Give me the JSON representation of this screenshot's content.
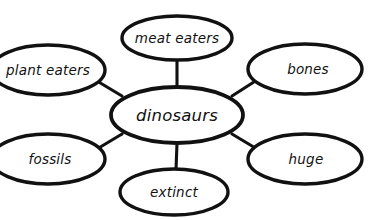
{
  "diagram": {
    "type": "concept-map",
    "background_color": "#ffffff",
    "stroke_color": "#111111",
    "text_color": "#111111",
    "central_node": {
      "id": "dinosaurs",
      "label": "dinosaurs",
      "cx": 177,
      "cy": 115,
      "rx": 66,
      "ry": 28
    },
    "satellite_nodes": [
      {
        "id": "meat-eaters",
        "label": "meat eaters",
        "position": "top",
        "cx": 177,
        "cy": 38,
        "rx": 55,
        "ry": 22
      },
      {
        "id": "bones",
        "label": "bones",
        "position": "top-right",
        "cx": 305,
        "cy": 69,
        "rx": 57,
        "ry": 25
      },
      {
        "id": "huge",
        "label": "huge",
        "position": "bottom-right",
        "cx": 305,
        "cy": 159,
        "rx": 57,
        "ry": 25
      },
      {
        "id": "extinct",
        "label": "extinct",
        "position": "bottom",
        "cx": 174,
        "cy": 192,
        "rx": 54,
        "ry": 23
      },
      {
        "id": "fossils",
        "label": "fossils",
        "position": "bottom-left",
        "cx": 48,
        "cy": 159,
        "rx": 57,
        "ry": 25
      },
      {
        "id": "plant-eaters",
        "label": "plant eaters",
        "position": "top-left",
        "cx": 48,
        "cy": 70,
        "rx": 57,
        "ry": 25
      }
    ],
    "edges": [
      {
        "id": "edge-meat-eaters",
        "from": "dinosaurs",
        "to": "meat-eaters",
        "x1": 177,
        "y1": 87,
        "x2": 177,
        "y2": 60
      },
      {
        "id": "edge-bones",
        "from": "dinosaurs",
        "to": "bones",
        "x1": 232,
        "y1": 96,
        "x2": 256,
        "y2": 80
      },
      {
        "id": "edge-huge",
        "from": "dinosaurs",
        "to": "huge",
        "x1": 232,
        "y1": 134,
        "x2": 256,
        "y2": 148
      },
      {
        "id": "edge-extinct",
        "from": "dinosaurs",
        "to": "extinct",
        "x1": 177,
        "y1": 143,
        "x2": 176,
        "y2": 170
      },
      {
        "id": "edge-fossils",
        "from": "dinosaurs",
        "to": "fossils",
        "x1": 122,
        "y1": 134,
        "x2": 98,
        "y2": 148
      },
      {
        "id": "edge-plant-eaters",
        "from": "dinosaurs",
        "to": "plant-eaters",
        "x1": 122,
        "y1": 96,
        "x2": 98,
        "y2": 82
      }
    ]
  }
}
